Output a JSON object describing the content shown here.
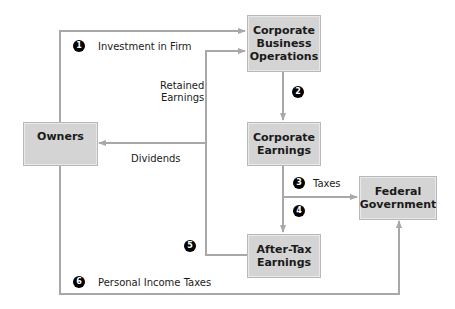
{
  "colors": {
    "box_fill": "#d4d4d4",
    "line": "#a8a8a8",
    "badge": "#000000"
  },
  "boxes": {
    "cbo": "Corporate Business Operations",
    "owners": "Owners",
    "earnings": "Corporate Earnings",
    "aftertax": "After-Tax Earnings",
    "federal": "Federal Government"
  },
  "cbo_lines": [
    "Corporate",
    "Business",
    "Operations"
  ],
  "earnings_lines": [
    "Corporate",
    "Earnings"
  ],
  "aftertax_lines": [
    "After-Tax",
    "Earnings"
  ],
  "federal_lines": [
    "Federal",
    "Government"
  ],
  "labels": {
    "investment": "Investment in Firm",
    "retained_1": "Retained",
    "retained_2": "Earnings",
    "dividends": "Dividends",
    "taxes": "Taxes",
    "personal": "Personal Income Taxes"
  },
  "steps": [
    "1",
    "2",
    "3",
    "4",
    "5",
    "6"
  ]
}
